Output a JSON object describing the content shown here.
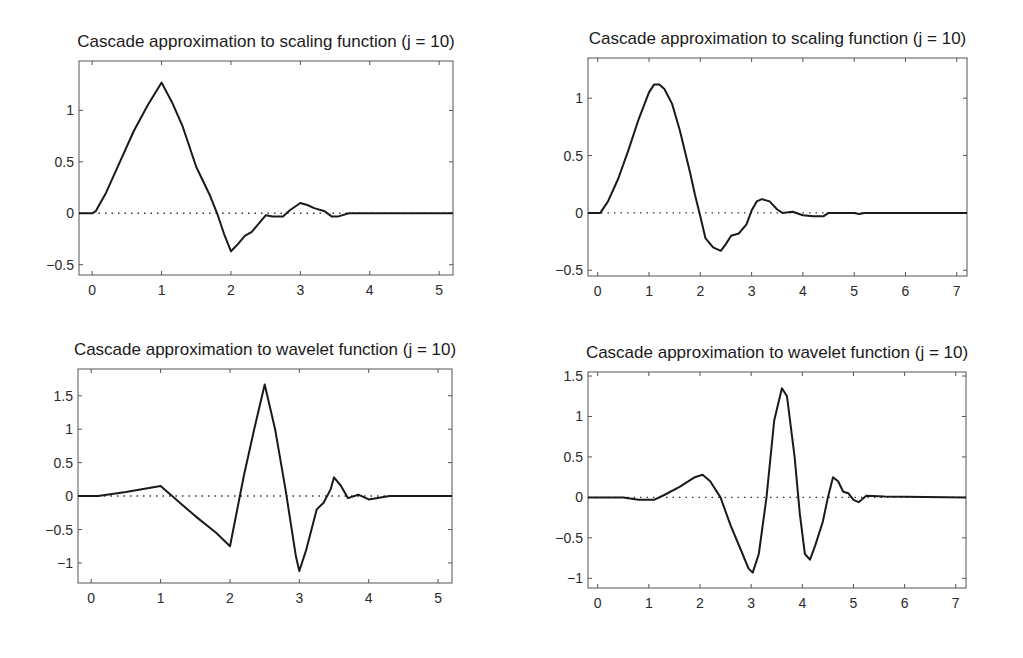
{
  "figure": {
    "background": "#ffffff",
    "line_color": "#1a1a1a"
  },
  "chart_data": [
    {
      "type": "line",
      "title": "Cascade approximation to scaling function (j = 10)",
      "xlabel": "",
      "ylabel": "",
      "xlim": [
        -0.19,
        5.2
      ],
      "ylim": [
        -0.6,
        1.48
      ],
      "xticks": [
        0,
        1,
        2,
        3,
        4,
        5
      ],
      "xtick_labels": [
        "0",
        "1",
        "2",
        "3",
        "4",
        "5"
      ],
      "yticks": [
        -0.5,
        0,
        0.5,
        1
      ],
      "ytick_labels": [
        "-0.5",
        "0",
        "0.5",
        "1"
      ],
      "grid": false,
      "zero_line": "dotted",
      "box": {
        "left": 79,
        "top": 61,
        "right": 453,
        "bottom": 275
      },
      "series": [
        {
          "name": "phi",
          "x": [
            -0.19,
            0,
            0.05,
            0.2,
            0.4,
            0.6,
            0.8,
            1.0,
            1.15,
            1.3,
            1.5,
            1.7,
            1.8,
            1.9,
            2.0,
            2.1,
            2.2,
            2.3,
            2.4,
            2.5,
            2.6,
            2.75,
            2.85,
            3.0,
            3.1,
            3.2,
            3.35,
            3.45,
            3.55,
            3.7,
            4.0,
            4.5,
            5.2
          ],
          "y": [
            0,
            0,
            0.02,
            0.2,
            0.5,
            0.8,
            1.05,
            1.27,
            1.08,
            0.85,
            0.45,
            0.17,
            0.0,
            -0.2,
            -0.37,
            -0.3,
            -0.22,
            -0.18,
            -0.1,
            -0.02,
            -0.03,
            -0.03,
            0.03,
            0.1,
            0.08,
            0.05,
            0.02,
            -0.03,
            -0.03,
            0.0,
            0.0,
            0.0,
            0.0
          ]
        }
      ]
    },
    {
      "type": "line",
      "title": "Cascade approximation to scaling function (j = 10)",
      "xlabel": "",
      "ylabel": "",
      "xlim": [
        -0.19,
        7.2
      ],
      "ylim": [
        -0.55,
        1.35
      ],
      "xticks": [
        0,
        1,
        2,
        3,
        4,
        5,
        6,
        7
      ],
      "xtick_labels": [
        "0",
        "1",
        "2",
        "3",
        "4",
        "5",
        "6",
        "7"
      ],
      "yticks": [
        -0.5,
        0,
        0.5,
        1
      ],
      "ytick_labels": [
        "-0.5",
        "0",
        "0.5",
        "1"
      ],
      "grid": false,
      "zero_line": "dotted",
      "box": {
        "left": 588,
        "top": 58,
        "right": 967,
        "bottom": 276
      },
      "series": [
        {
          "name": "phi",
          "x": [
            -0.19,
            0.05,
            0.2,
            0.4,
            0.6,
            0.8,
            1.0,
            1.1,
            1.2,
            1.3,
            1.45,
            1.6,
            1.8,
            1.9,
            2.0,
            2.1,
            2.25,
            2.4,
            2.5,
            2.6,
            2.75,
            2.9,
            3.0,
            3.1,
            3.2,
            3.35,
            3.5,
            3.6,
            3.8,
            4.0,
            4.2,
            4.4,
            4.5,
            5.0,
            5.1,
            5.2,
            7.2
          ],
          "y": [
            0,
            0.0,
            0.1,
            0.3,
            0.55,
            0.82,
            1.05,
            1.12,
            1.12,
            1.08,
            0.95,
            0.72,
            0.35,
            0.15,
            -0.03,
            -0.22,
            -0.3,
            -0.33,
            -0.27,
            -0.2,
            -0.18,
            -0.1,
            0.02,
            0.1,
            0.12,
            0.1,
            0.03,
            0.0,
            0.01,
            -0.02,
            -0.03,
            -0.03,
            0.0,
            0.0,
            -0.01,
            0.0,
            0.0
          ]
        }
      ]
    },
    {
      "type": "line",
      "title": "Cascade approximation to wavelet function (j = 10)",
      "xlabel": "",
      "ylabel": "",
      "xlim": [
        -0.19,
        5.2
      ],
      "ylim": [
        -1.3,
        1.9
      ],
      "xticks": [
        0,
        1,
        2,
        3,
        4,
        5
      ],
      "xtick_labels": [
        "0",
        "1",
        "2",
        "3",
        "4",
        "5"
      ],
      "yticks": [
        -1,
        -0.5,
        0,
        0.5,
        1,
        1.5
      ],
      "ytick_labels": [
        "-1",
        "-0.5",
        "0",
        "0.5",
        "1",
        "1.5"
      ],
      "grid": false,
      "zero_line": "dotted",
      "box": {
        "left": 78,
        "top": 369,
        "right": 452,
        "bottom": 583
      },
      "series": [
        {
          "name": "psi",
          "x": [
            -0.19,
            0.1,
            0.5,
            1.0,
            1.2,
            1.5,
            1.8,
            2.0,
            2.2,
            2.35,
            2.5,
            2.65,
            2.8,
            2.95,
            3.0,
            3.1,
            3.25,
            3.35,
            3.45,
            3.5,
            3.6,
            3.7,
            3.85,
            4.0,
            4.3,
            5.2
          ],
          "y": [
            0,
            0.0,
            0.06,
            0.15,
            -0.03,
            -0.3,
            -0.55,
            -0.75,
            0.3,
            1.0,
            1.67,
            1.0,
            0.1,
            -0.9,
            -1.12,
            -0.8,
            -0.2,
            -0.1,
            0.1,
            0.28,
            0.15,
            -0.03,
            0.02,
            -0.05,
            0.0,
            0.0
          ]
        }
      ]
    },
    {
      "type": "line",
      "title": "Cascade approximation to wavelet function (j = 10)",
      "xlabel": "",
      "ylabel": "",
      "xlim": [
        -0.19,
        7.2
      ],
      "ylim": [
        -1.12,
        1.55
      ],
      "xticks": [
        0,
        1,
        2,
        3,
        4,
        5,
        6,
        7
      ],
      "xtick_labels": [
        "0",
        "1",
        "2",
        "3",
        "4",
        "5",
        "6",
        "7"
      ],
      "yticks": [
        -1,
        -0.5,
        0,
        0.5,
        1,
        1.5
      ],
      "ytick_labels": [
        "-1",
        "-0.5",
        "0",
        "0.5",
        "1",
        "1.5"
      ],
      "grid": false,
      "zero_line": "dotted",
      "box": {
        "left": 588,
        "top": 372,
        "right": 966,
        "bottom": 588
      },
      "series": [
        {
          "name": "psi",
          "x": [
            -0.19,
            0.5,
            0.8,
            1.1,
            1.3,
            1.6,
            1.9,
            2.05,
            2.2,
            2.4,
            2.6,
            2.8,
            2.95,
            3.03,
            3.15,
            3.3,
            3.45,
            3.6,
            3.7,
            3.85,
            3.95,
            4.05,
            4.15,
            4.25,
            4.4,
            4.5,
            4.6,
            4.7,
            4.8,
            4.9,
            5.0,
            5.1,
            5.25,
            5.6,
            7.2
          ],
          "y": [
            0,
            0.0,
            -0.03,
            -0.03,
            0.03,
            0.13,
            0.25,
            0.28,
            0.2,
            0.0,
            -0.35,
            -0.65,
            -0.88,
            -0.93,
            -0.7,
            0.0,
            0.95,
            1.35,
            1.25,
            0.5,
            -0.2,
            -0.7,
            -0.77,
            -0.6,
            -0.3,
            0.0,
            0.25,
            0.2,
            0.07,
            0.05,
            -0.03,
            -0.06,
            0.02,
            0.01,
            0.0
          ]
        }
      ]
    }
  ]
}
